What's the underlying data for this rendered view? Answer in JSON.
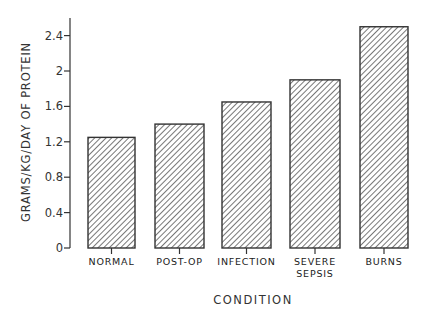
{
  "chart_data": {
    "type": "bar",
    "title": "",
    "xlabel": "CONDITION",
    "ylabel": "GRAMS/KG/DAY OF PROTEIN",
    "categories": [
      "NORMAL",
      "POST-OP",
      "INFECTION",
      "SEVERE\nSEPSIS",
      "BURNS"
    ],
    "values": [
      1.25,
      1.4,
      1.65,
      1.9,
      2.5
    ],
    "yticks": [
      "0",
      "0.4",
      "0.8",
      "1.2",
      "1.6",
      "2",
      "2.4"
    ],
    "ylim": [
      0,
      2.6
    ],
    "grid": false,
    "legend": null,
    "bar_fill": "diagonal hatch",
    "colors": {
      "bar_edge": "#333333",
      "hatch": "#555555",
      "axis": "#333333"
    }
  }
}
